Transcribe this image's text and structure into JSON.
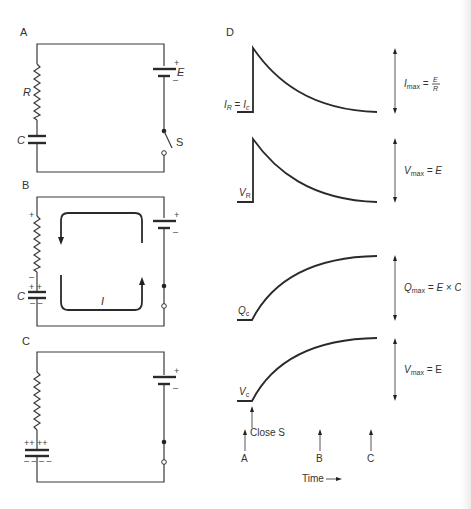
{
  "figure": {
    "panels": {
      "A": {
        "label": "A",
        "components": {
          "resistor": "R",
          "capacitor": "C",
          "battery": "E",
          "switch": "S"
        },
        "battery_plus": "+",
        "battery_minus": "–",
        "switch_state": "open"
      },
      "B": {
        "label": "B",
        "resistor_plus": "+",
        "resistor_minus": "–",
        "capacitor": "C",
        "capacitor_top": "+ +",
        "capacitor_bottom": "– –",
        "battery_plus": "+",
        "battery_minus": "–",
        "current_label": "I",
        "switch_state": "closed"
      },
      "C": {
        "label": "C",
        "capacitor_top": "++ ++",
        "capacitor_bottom": "– – – –",
        "battery_plus": "+",
        "battery_minus": "–",
        "switch_state": "closed"
      },
      "D": {
        "label": "D",
        "graphs": [
          {
            "name": "current",
            "curve_label_main": "I",
            "curve_label_sub": "R",
            "curve_label_eq": " = ",
            "curve_label_main2": "I",
            "curve_label_sub2": "c",
            "range_main": "I",
            "range_sub": "max",
            "range_eq": " = ",
            "range_num": "E",
            "range_den": "R",
            "shape": "decay"
          },
          {
            "name": "resistor-voltage",
            "curve_label_main": "V",
            "curve_label_sub": "R",
            "range_main": "V",
            "range_sub": "max",
            "range_rest": " = E",
            "shape": "decay"
          },
          {
            "name": "capacitor-charge",
            "curve_label_main": "Q",
            "curve_label_sub": "c",
            "range_main": "Q",
            "range_sub": "max",
            "range_rest": " = E × C",
            "shape": "growth"
          },
          {
            "name": "capacitor-voltage",
            "curve_label_main": "V",
            "curve_label_sub": "c",
            "range_main": "V",
            "range_sub": "max",
            "range_rest": " = E",
            "shape": "growth"
          }
        ],
        "time_markers": [
          "A",
          "B",
          "C"
        ],
        "event_label": "Close S",
        "time_axis_label": "Time"
      }
    }
  }
}
